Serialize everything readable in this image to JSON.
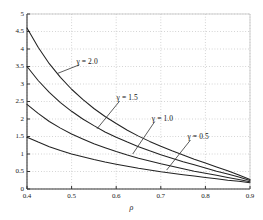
{
  "chart_data": {
    "type": "line",
    "title": "",
    "subtitle": "",
    "xlabel": "ρ",
    "ylabel": "",
    "xlim": [
      0.4,
      0.9
    ],
    "ylim": [
      0,
      5
    ],
    "grid": true,
    "grid_style": "dotted",
    "legend_position": "inline-annotations",
    "xticks": [
      "0.4",
      "0.5",
      "0.6",
      "0.7",
      "0.8",
      "0.9"
    ],
    "xtick_values": [
      0.4,
      0.5,
      0.6,
      0.7,
      0.8,
      0.9
    ],
    "yticks": [
      "0",
      "0.5",
      "1",
      "1.5",
      "2",
      "2.5",
      "3",
      "3.5",
      "4",
      "4.5",
      "5"
    ],
    "ytick_values": [
      0,
      0.5,
      1,
      1.5,
      2,
      2.5,
      3,
      3.5,
      4,
      4.5,
      5
    ],
    "x": [
      0.4,
      0.425,
      0.45,
      0.475,
      0.5,
      0.525,
      0.55,
      0.575,
      0.6,
      0.625,
      0.65,
      0.675,
      0.7,
      0.725,
      0.75,
      0.775,
      0.8,
      0.825,
      0.85,
      0.875,
      0.9
    ],
    "series": [
      {
        "name": "γ = 2.0",
        "gamma": 2.0,
        "color": "#222222",
        "values": [
          4.6,
          4.05,
          3.58,
          3.19,
          2.85,
          2.56,
          2.3,
          2.07,
          1.87,
          1.68,
          1.51,
          1.36,
          1.22,
          1.09,
          0.97,
          0.85,
          0.74,
          0.63,
          0.52,
          0.4,
          0.27
        ],
        "annotation": {
          "text": "γ = 2.0",
          "label_x": 0.513,
          "label_y": 3.62,
          "point_x": 0.468,
          "point_y": 3.3
        }
      },
      {
        "name": "γ = 1.5",
        "gamma": 1.5,
        "color": "#222222",
        "values": [
          3.5,
          3.1,
          2.76,
          2.47,
          2.22,
          2.0,
          1.81,
          1.63,
          1.48,
          1.34,
          1.21,
          1.09,
          0.98,
          0.88,
          0.78,
          0.69,
          0.6,
          0.51,
          0.43,
          0.34,
          0.24
        ],
        "annotation": {
          "text": "γ = 1.5",
          "label_x": 0.603,
          "label_y": 2.58,
          "point_x": 0.557,
          "point_y": 1.72
        }
      },
      {
        "name": "γ = 1.0",
        "gamma": 1.0,
        "color": "#222222",
        "values": [
          2.42,
          2.16,
          1.93,
          1.74,
          1.57,
          1.43,
          1.29,
          1.18,
          1.07,
          0.97,
          0.88,
          0.8,
          0.72,
          0.65,
          0.58,
          0.51,
          0.45,
          0.39,
          0.33,
          0.27,
          0.21
        ],
        "annotation": {
          "text": "γ = 1.0",
          "label_x": 0.682,
          "label_y": 2.0,
          "point_x": 0.637,
          "point_y": 1.0
        }
      },
      {
        "name": "γ = 0.5",
        "gamma": 0.5,
        "color": "#222222",
        "values": [
          1.48,
          1.34,
          1.21,
          1.1,
          1.0,
          0.92,
          0.84,
          0.77,
          0.71,
          0.65,
          0.59,
          0.54,
          0.49,
          0.45,
          0.41,
          0.37,
          0.33,
          0.29,
          0.25,
          0.22,
          0.18
        ],
        "annotation": {
          "text": "γ = 0.5",
          "label_x": 0.762,
          "label_y": 1.47,
          "point_x": 0.713,
          "point_y": 0.54
        }
      }
    ]
  },
  "axis": {
    "x_title": "ρ"
  }
}
